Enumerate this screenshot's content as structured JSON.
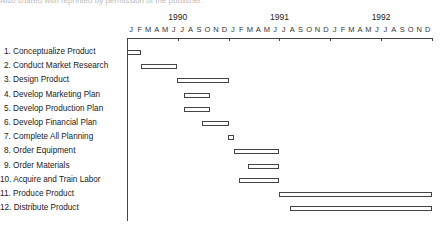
{
  "caption": "Also shared with reprinted by permission of the publisher.",
  "chart_data": {
    "type": "gantt",
    "title": "",
    "years": [
      "1990",
      "1991",
      "1992"
    ],
    "months": [
      "J",
      "F",
      "M",
      "A",
      "M",
      "J",
      "J",
      "A",
      "S",
      "O",
      "N",
      "D",
      "J",
      "F",
      "M",
      "A",
      "M",
      "J",
      "J",
      "A",
      "S",
      "O",
      "N",
      "D",
      "J",
      "F",
      "M",
      "A",
      "M",
      "J",
      "J",
      "A",
      "S",
      "O",
      "N",
      "D"
    ],
    "tasks": [
      {
        "label": "1. Conceptualize Product",
        "start": "1990-01",
        "end": "1990-02",
        "start_idx": 0,
        "end_idx": 1.7
      },
      {
        "label": "2. Conduct Market Research",
        "start": "1990-03",
        "end": "1990-06",
        "start_idx": 1.7,
        "end_idx": 5.9
      },
      {
        "label": "3. Design Product",
        "start": "1990-07",
        "end": "1990-12",
        "start_idx": 5.9,
        "end_idx": 12
      },
      {
        "label": "4. Develop Marketing Plan",
        "start": "1990-08",
        "end": "1990-10",
        "start_idx": 6.7,
        "end_idx": 9.8
      },
      {
        "label": "5. Develop Production Plan",
        "start": "1990-08",
        "end": "1990-10",
        "start_idx": 6.7,
        "end_idx": 9.8
      },
      {
        "label": "6. Develop Financial Plan",
        "start": "1990-10",
        "end": "1990-12",
        "start_idx": 8.9,
        "end_idx": 12
      },
      {
        "label": "7. Complete All Planning",
        "start": "1991-01",
        "end": "1991-01",
        "start_idx": 11.9,
        "end_idx": 12.6
      },
      {
        "label": "8. Order Equipment",
        "start": "1991-02",
        "end": "1991-06",
        "start_idx": 12.6,
        "end_idx": 18
      },
      {
        "label": "9. Order Materials",
        "start": "1991-04",
        "end": "1991-06",
        "start_idx": 14.3,
        "end_idx": 18
      },
      {
        "label": "10. Acquire and Train Labor",
        "start": "1991-02",
        "end": "1991-06",
        "start_idx": 13.2,
        "end_idx": 18
      },
      {
        "label": "11. Produce Product",
        "start": "1991-07",
        "end": "1992-12",
        "start_idx": 18,
        "end_idx": 36
      },
      {
        "label": "12. Distribute Product",
        "start": "1991-08",
        "end": "1992-12",
        "start_idx": 19.2,
        "end_idx": 36
      }
    ],
    "xlabel": "",
    "ylabel": "",
    "grid": false
  }
}
